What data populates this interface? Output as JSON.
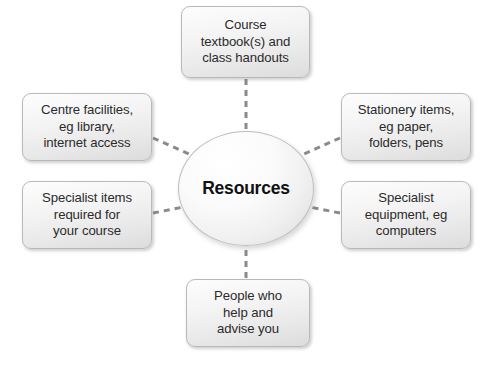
{
  "diagram": {
    "title": "Resources",
    "center": {
      "label": "Resources",
      "shape": "ellipse",
      "fill": "#f2f2f2",
      "border": "#bdbdbd",
      "text_color": "#111111"
    },
    "connector": {
      "style": "dashed",
      "color": "#8a8a8a",
      "width": 3
    },
    "background": "#ffffff",
    "node_style": {
      "fill_top": "#fdfdfd",
      "fill_bottom": "#dcdcdc",
      "border": "#b9b9b9",
      "text_color": "#2b2b2b",
      "corner_radius": 9
    },
    "nodes": [
      {
        "id": "course-textbooks",
        "position": "top",
        "lines": [
          "Course",
          "textbook(s) and",
          "class handouts"
        ],
        "text": "Course textbook(s) and class handouts"
      },
      {
        "id": "centre-facilities",
        "position": "left-upper",
        "lines": [
          "Centre facilities,",
          "eg library,",
          "internet access"
        ],
        "text": "Centre facilities, eg library, internet access"
      },
      {
        "id": "stationery-items",
        "position": "right-upper",
        "lines": [
          "Stationery items,",
          "eg paper,",
          "folders, pens"
        ],
        "text": "Stationery items, eg paper, folders, pens"
      },
      {
        "id": "specialist-items",
        "position": "left-lower",
        "lines": [
          "Specialist items",
          "required for",
          "your course"
        ],
        "text": "Specialist items required for your course"
      },
      {
        "id": "specialist-equipment",
        "position": "right-lower",
        "lines": [
          "Specialist",
          "equipment, eg",
          "computers"
        ],
        "text": "Specialist equipment, eg computers"
      },
      {
        "id": "people-who-help",
        "position": "bottom",
        "lines": [
          "People who",
          "help and",
          "advise you"
        ],
        "text": "People who help and advise you"
      }
    ]
  }
}
